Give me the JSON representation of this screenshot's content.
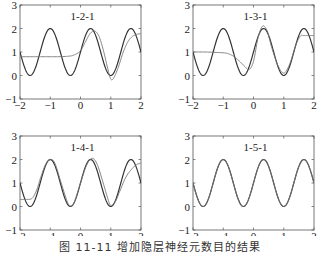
{
  "caption": "图 11-11  增加隐层神经元数目的结果",
  "chart_data": [
    {
      "type": "line",
      "title": "1-2-1",
      "xlabel": "",
      "ylabel": "",
      "xlim": [
        -2,
        2
      ],
      "ylim": [
        -1,
        3
      ],
      "xticks": [
        -2,
        -1,
        0,
        1,
        2
      ],
      "yticks": [
        -1,
        0,
        1,
        2,
        3
      ],
      "xtick_labels": [
        "−2",
        "−1",
        "0",
        "1",
        "2"
      ],
      "ytick_labels": [
        "−1",
        "0",
        "1",
        "2",
        "3"
      ],
      "grid": false,
      "series": [
        {
          "name": "target",
          "function": "1+cos(1.5*pi*(x+1))"
        },
        {
          "name": "network output",
          "x": [
            -2,
            -1.6,
            -1.2,
            -0.8,
            -0.4,
            -0.2,
            0,
            0.15,
            0.3,
            0.45,
            0.6,
            0.75,
            0.9,
            1.0,
            1.1,
            1.25,
            1.4,
            1.55,
            1.7,
            1.85,
            2.0
          ],
          "y": [
            0.8,
            0.8,
            0.8,
            0.8,
            0.82,
            0.88,
            1.05,
            1.4,
            1.75,
            1.9,
            1.7,
            1.1,
            0.3,
            -0.15,
            -0.1,
            0.35,
            0.95,
            1.4,
            1.65,
            1.75,
            1.78
          ]
        }
      ]
    },
    {
      "type": "line",
      "title": "1-3-1",
      "xlabel": "",
      "ylabel": "",
      "xlim": [
        -2,
        2
      ],
      "ylim": [
        -1,
        3
      ],
      "xticks": [
        -2,
        -1,
        0,
        1,
        2
      ],
      "yticks": [
        -1,
        0,
        1,
        2,
        3
      ],
      "xtick_labels": [
        "−2",
        "−1",
        "0",
        "1",
        "2"
      ],
      "ytick_labels": [
        "−1",
        "0",
        "1",
        "2",
        "3"
      ],
      "grid": false,
      "series": [
        {
          "name": "target",
          "function": "1+cos(1.5*pi*(x+1))"
        },
        {
          "name": "network output",
          "x": [
            -2,
            -1.6,
            -1.2,
            -0.9,
            -0.7,
            -0.5,
            -0.3,
            -0.15,
            0,
            0.15,
            0.3,
            0.45,
            0.6,
            0.8,
            1.0,
            1.2,
            1.4,
            1.55,
            1.65,
            1.8,
            2.0
          ],
          "y": [
            1.0,
            1.0,
            0.98,
            0.95,
            0.85,
            0.65,
            0.4,
            0.25,
            0.6,
            1.6,
            2.1,
            1.9,
            1.2,
            0.45,
            0.1,
            0.5,
            1.3,
            1.68,
            1.7,
            1.7,
            1.7
          ]
        }
      ]
    },
    {
      "type": "line",
      "title": "1-4-1",
      "xlabel": "",
      "ylabel": "",
      "xlim": [
        -2,
        2
      ],
      "ylim": [
        -1,
        3
      ],
      "xticks": [
        -2,
        -1,
        0,
        1,
        2
      ],
      "yticks": [
        -1,
        0,
        1,
        2,
        3
      ],
      "xtick_labels": [
        "−2",
        "−1",
        "0",
        "1",
        "2"
      ],
      "ytick_labels": [
        "−1",
        "0",
        "1",
        "2",
        "3"
      ],
      "grid": false,
      "series": [
        {
          "name": "target",
          "function": "1+cos(1.5*pi*(x+1))"
        },
        {
          "name": "network output",
          "x": [
            -2,
            -1.8,
            -1.6,
            -1.45,
            -1.3,
            -1.15,
            -1.0,
            -0.85,
            -0.65,
            -0.45,
            -0.33,
            -0.2,
            0,
            0.2,
            0.38,
            0.55,
            0.75,
            0.9,
            1.0,
            1.15,
            1.3,
            1.5,
            1.7,
            1.85,
            2.0
          ],
          "y": [
            0.3,
            0.3,
            0.35,
            0.7,
            1.3,
            1.8,
            2.0,
            1.85,
            1.05,
            0.25,
            0.02,
            0.2,
            1.0,
            1.75,
            2.05,
            1.8,
            1.0,
            0.35,
            0.05,
            0.2,
            0.65,
            1.25,
            1.6,
            1.78,
            1.85
          ]
        }
      ]
    },
    {
      "type": "line",
      "title": "1-5-1",
      "xlabel": "",
      "ylabel": "",
      "xlim": [
        -2,
        2
      ],
      "ylim": [
        -1,
        3
      ],
      "xticks": [
        -2,
        -1,
        0,
        1,
        2
      ],
      "yticks": [
        -1,
        0,
        1,
        2,
        3
      ],
      "xtick_labels": [
        "−2",
        "−1",
        "0",
        "1",
        "2"
      ],
      "ytick_labels": [
        "−1",
        "0",
        "1",
        "2",
        "3"
      ],
      "grid": false,
      "series": [
        {
          "name": "target",
          "function": "1+cos(1.5*pi*(x+1))"
        },
        {
          "name": "network output",
          "function": "1+cos(1.5*pi*(x+1))"
        }
      ]
    }
  ]
}
